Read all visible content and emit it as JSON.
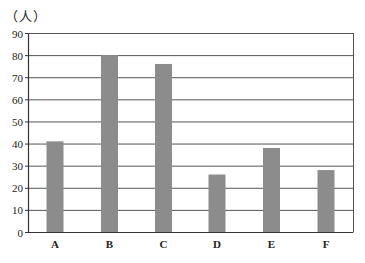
{
  "chart_data": {
    "type": "bar",
    "title": "",
    "unit_label": "（人）",
    "xlabel": "",
    "ylabel": "（人）",
    "categories": [
      "A",
      "B",
      "C",
      "D",
      "E",
      "F"
    ],
    "values": [
      41,
      80,
      76,
      26,
      38,
      28
    ],
    "ylim": [
      0,
      90
    ],
    "yticks": [
      0,
      10,
      20,
      30,
      40,
      50,
      60,
      70,
      80,
      90
    ],
    "grid": true,
    "legend": null,
    "bar_color": "#8c8c8c",
    "grid_color": "#555555"
  }
}
